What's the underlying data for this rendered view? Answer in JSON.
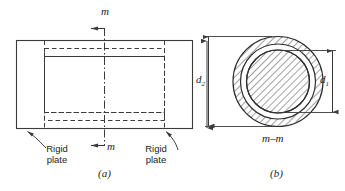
{
  "figure": {
    "type": "engineering-drawing",
    "line_color": "#3a3a3a",
    "hatch_color": "#4a4a4a",
    "text_color": "#1d1d1d",
    "background": "#ffffff"
  },
  "view_a": {
    "caption": "(a)",
    "section_label_top": "m",
    "section_label_bottom": "m",
    "left_plate_label_line1": "Rigid",
    "left_plate_label_line2": "plate",
    "right_plate_label_line1": "Rigid",
    "right_plate_label_line2": "plate",
    "outer_diameter_label": "d",
    "outer_diameter_subscript": "2"
  },
  "view_b": {
    "caption": "(b)",
    "section_title": "m–m",
    "outer_diameter_label": "d",
    "outer_diameter_subscript": "2",
    "inner_diameter_label": "d",
    "inner_diameter_subscript": "1"
  }
}
